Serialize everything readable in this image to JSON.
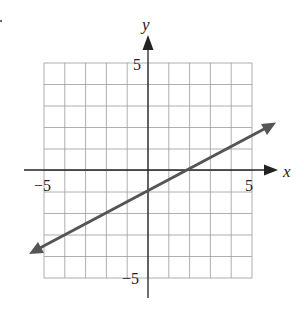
{
  "chart_data": {
    "type": "line",
    "title": "",
    "xlabel": "x",
    "ylabel": "y",
    "xlim": [
      -5,
      5
    ],
    "ylim": [
      -5,
      5
    ],
    "grid": true,
    "x_ticks_labeled": [
      -5,
      5
    ],
    "y_ticks_labeled": [
      -5,
      5
    ],
    "series": [
      {
        "name": "line",
        "equation": "y = 0.5x - 1",
        "slope": 0.5,
        "intercept": -1,
        "points": [
          [
            -5.6,
            -3.8
          ],
          [
            0,
            -1
          ],
          [
            2,
            0
          ],
          [
            6.2,
            2.1
          ]
        ],
        "arrows": "both"
      }
    ]
  },
  "labels": {
    "x_axis": "x",
    "y_axis": "y",
    "x_min": "−5",
    "x_max": "5",
    "y_max": "5",
    "y_min": "−5"
  }
}
